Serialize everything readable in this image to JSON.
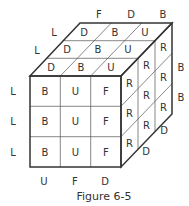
{
  "figure": {
    "caption": "Figure 6-5",
    "front_face": [
      [
        "B",
        "U",
        "F"
      ],
      [
        "B",
        "U",
        "F"
      ],
      [
        "B",
        "U",
        "F"
      ]
    ],
    "top_face": [
      [
        "D",
        "B",
        "U"
      ],
      [
        "D",
        "B",
        "U"
      ],
      [
        "D",
        "B",
        "U"
      ]
    ],
    "right_face": [
      [
        "R",
        "R",
        "R"
      ],
      [
        "R",
        "R",
        "R"
      ],
      [
        "R",
        "R",
        "R"
      ]
    ],
    "left_labels": [
      "L",
      "L",
      "L"
    ],
    "top_left_labels": [
      "L",
      "L"
    ],
    "top_back_labels": [
      "F",
      "D",
      "B"
    ],
    "bottom_labels": [
      "U",
      "F",
      "D"
    ],
    "right_labels": [
      "B",
      "B"
    ],
    "right_bottom_labels": [
      "D",
      "D"
    ]
  }
}
